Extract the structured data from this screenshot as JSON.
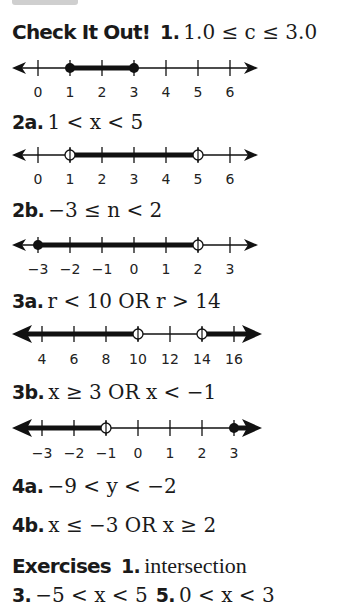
{
  "header_tab": {
    "color": "#cfcfcf"
  },
  "check_it_out": {
    "heading": "Check It Out!",
    "items": [
      {
        "label": "1.",
        "expression": "1.0 ≤ c ≤ 3.0"
      },
      {
        "label": "2a.",
        "expression": "1 < x < 5"
      },
      {
        "label": "2b.",
        "expression": "−3 ≤ n < 2"
      },
      {
        "label": "3a.",
        "expression": "r < 10 OR r > 14"
      },
      {
        "label": "3b.",
        "expression": "x ≥ 3 OR x < −1"
      },
      {
        "label": "4a.",
        "expression": "−9 < y < −2"
      },
      {
        "label": "4b.",
        "expression": "x ≤ −3 OR x ≥ 2"
      }
    ]
  },
  "number_lines": [
    {
      "for": "1",
      "ticks": [
        "0",
        "1",
        "2",
        "3",
        "4",
        "5",
        "6"
      ],
      "shaded": "1 to 3",
      "endpoints": [
        "closed at 1",
        "closed at 3"
      ]
    },
    {
      "for": "2a",
      "ticks": [
        "0",
        "1",
        "2",
        "3",
        "4",
        "5",
        "6"
      ],
      "shaded": "1 to 5",
      "endpoints": [
        "open at 1",
        "open at 5"
      ]
    },
    {
      "for": "2b",
      "ticks": [
        "−3",
        "−2",
        "−1",
        "0",
        "1",
        "2",
        "3"
      ],
      "shaded": "−3 to 2",
      "endpoints": [
        "closed at −3",
        "open at 2"
      ]
    },
    {
      "for": "3a",
      "ticks": [
        "4",
        "6",
        "8",
        "10",
        "12",
        "14",
        "16"
      ],
      "shaded": "left of 10, right of 14",
      "endpoints": [
        "open at 10",
        "open at 14"
      ]
    },
    {
      "for": "3b",
      "ticks": [
        "−3",
        "−2",
        "−1",
        "0",
        "1",
        "2",
        "3"
      ],
      "shaded": "left of −1, right of 3",
      "endpoints": [
        "open at −1",
        "closed at 3"
      ]
    }
  ],
  "exercises": {
    "heading": "Exercises",
    "items": [
      {
        "label": "1.",
        "text": "intersection"
      },
      {
        "label": "3.",
        "expression": "−5 < x < 5"
      },
      {
        "label": "5.",
        "expression": "0 < x < 3"
      }
    ]
  }
}
